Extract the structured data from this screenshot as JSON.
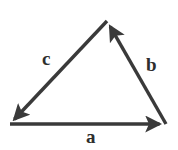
{
  "figure": {
    "background_color": "#ffffff",
    "stroke_color": "#3a3a3a",
    "label_color": "#2e2e2e",
    "stroke_width": 3.4,
    "labels": {
      "a": "a",
      "b": "b",
      "c": "c"
    },
    "vertices": {
      "bottom_left": {
        "x": 10,
        "y": 124
      },
      "bottom_right": {
        "x": 166,
        "y": 124
      },
      "apex": {
        "x": 107,
        "y": 21
      }
    },
    "vectors": [
      {
        "name": "a",
        "label": "a",
        "from": "bottom_left",
        "to": "bottom_right",
        "arrowhead_at": "bottom_right"
      },
      {
        "name": "b",
        "label": "b",
        "from": "bottom_right",
        "to": "apex",
        "arrowhead_at": "apex"
      },
      {
        "name": "c",
        "label": "c",
        "from": "apex",
        "to": "bottom_left",
        "arrowhead_at": "bottom_left"
      }
    ]
  }
}
